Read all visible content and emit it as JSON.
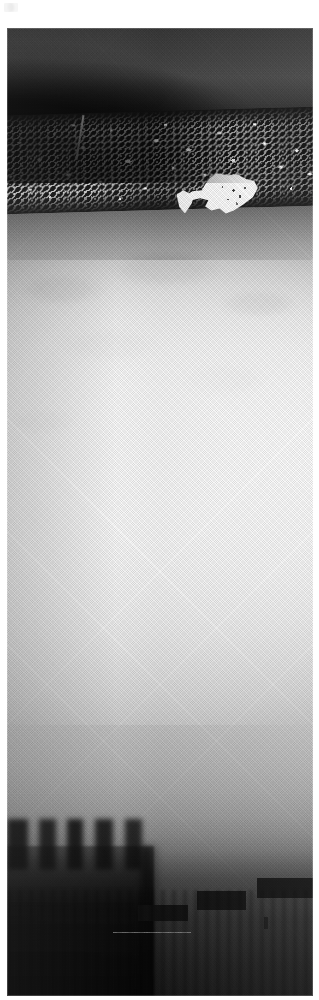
{
  "document": {
    "type": "scanned-halftone-photograph",
    "media": "newsprint / microfilm scan",
    "page_background": "#ffffff",
    "caption": "",
    "title": "",
    "visible_text": []
  },
  "photo": {
    "name": "scanned-photograph",
    "alt_description": "High-contrast black and white halftone photograph: a dark sky band across the top, a bright speckled horizontal band of foam or foliage, a large hazy white expanse filling the middle, and a dark silhouetted foreground with window-like rectangles at the bottom right.",
    "orientation": "portrait",
    "frame": {
      "left": 7,
      "top": 28,
      "width": 306,
      "height": 968
    },
    "regions": [
      {
        "name": "sky-band",
        "label": "dark sky band",
        "tone": "#3a3a3a",
        "y_range_pct": [
          0,
          9
        ]
      },
      {
        "name": "speckle-band",
        "label": "bright speckled band",
        "tone": "#0e0e0e",
        "y_range_pct": [
          9,
          19
        ]
      },
      {
        "name": "white-blob",
        "label": "white splash highlight",
        "tone": "#fdfdfd",
        "y_range_pct": [
          15,
          21
        ]
      },
      {
        "name": "haze-field",
        "label": "bright hazy middle field",
        "tone": "#f2f2f2",
        "y_range_pct": [
          24,
          72
        ]
      },
      {
        "name": "gradient-fall",
        "label": "tonal falloff to dark",
        "tone": "#9e9e9e",
        "y_range_pct": [
          72,
          85
        ]
      },
      {
        "name": "foreground-mass",
        "label": "dark foreground silhouette",
        "tone": "#0a0a0a",
        "y_range_pct": [
          85,
          100
        ]
      },
      {
        "name": "window-bars",
        "label": "dark rectangular windows",
        "tone": "#111111",
        "y_range_pct": [
          86,
          96
        ]
      }
    ],
    "palette": {
      "highlight": "#fdfdfd",
      "paper": "#ffffff",
      "midtone": "#9e9e9e",
      "shadow": "#1b1b1b",
      "deep_shadow": "#060606"
    }
  },
  "artifacts": {
    "corner_mark": {
      "name": "scan-artifact-mark",
      "position": "top-left",
      "visible": true
    }
  }
}
